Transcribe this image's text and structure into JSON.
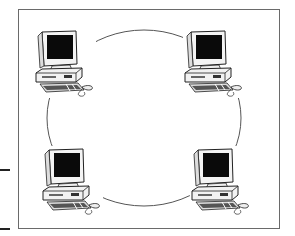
{
  "diagram": {
    "type": "ring-network-topology",
    "ring": {
      "cx": 144,
      "cy": 118,
      "rx": 97,
      "ry": 88,
      "stroke": "#555555"
    },
    "frame": {
      "x": 18,
      "y": 9,
      "w": 262,
      "h": 220,
      "stroke": "#6a6a6a"
    },
    "nodes": [
      {
        "id": "computer-top-left",
        "icon": "desktop-computer-icon",
        "x": 36,
        "y": 30
      },
      {
        "id": "computer-top-right",
        "icon": "desktop-computer-icon",
        "x": 185,
        "y": 30
      },
      {
        "id": "computer-bottom-left",
        "icon": "desktop-computer-icon",
        "x": 43,
        "y": 148
      },
      {
        "id": "computer-bottom-right",
        "icon": "desktop-computer-icon",
        "x": 192,
        "y": 148
      }
    ],
    "side_marks": [
      {
        "y": 169
      },
      {
        "y": 228
      }
    ]
  }
}
